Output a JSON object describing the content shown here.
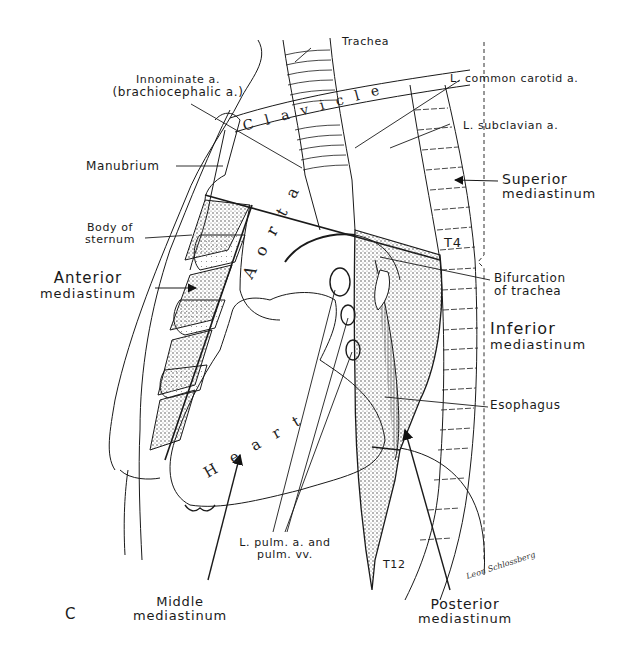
{
  "figure": {
    "panel_letter": "C",
    "signature": "Leon Schlossberg",
    "organ_labels": {
      "clavicle": "Clavicle",
      "aorta": "Aorta",
      "heart": "Heart"
    },
    "vertebra_labels": {
      "t4": "T4",
      "t12": "T12"
    },
    "labels": {
      "trachea": "Trachea",
      "innominate_line1": "Innominate a.",
      "innominate_line2": "(brachiocephalic a.)",
      "l_common_carotid": "L. common carotid a.",
      "l_subclavian": "L. subclavian a.",
      "manubrium": "Manubrium",
      "superior_line1": "Superior",
      "superior_line2": "mediastinum",
      "body_of_sternum_line1": "Body of",
      "body_of_sternum_line2": "sternum",
      "anterior_line1": "Anterior",
      "anterior_line2": "mediastinum",
      "bifurcation_line1": "Bifurcation",
      "bifurcation_line2": "of trachea",
      "inferior_line1": "Inferior",
      "inferior_line2": "mediastinum",
      "esophagus": "Esophagus",
      "pulm_line1": "L. pulm. a. and",
      "pulm_line2": "pulm. vv.",
      "middle_line1": "Middle",
      "middle_line2": "mediastinum",
      "posterior_line1": "Posterior",
      "posterior_line2": "mediastinum"
    }
  }
}
